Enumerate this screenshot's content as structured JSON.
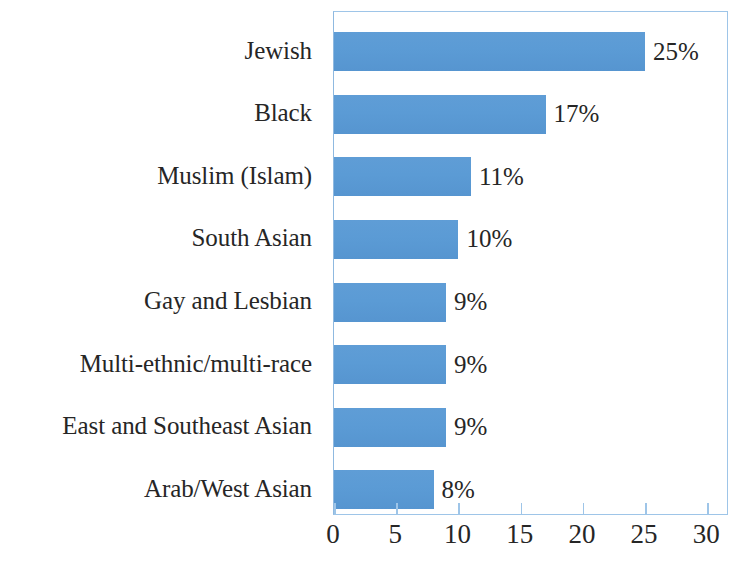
{
  "chart_data": {
    "type": "bar",
    "orientation": "horizontal",
    "title": "",
    "subtitle": "",
    "xlabel": "",
    "ylabel": "",
    "categories": [
      "Jewish",
      "Black",
      "Muslim (Islam)",
      "South Asian",
      "Gay and Lesbian",
      "Multi-ethnic/multi-race",
      "East and Southeast Asian",
      "Arab/West Asian"
    ],
    "values": [
      25,
      17,
      11,
      10,
      9,
      9,
      9,
      8
    ],
    "value_labels": [
      "25%",
      "17%",
      "11%",
      "10%",
      "9%",
      "9%",
      "9%",
      "8%"
    ],
    "xlim": [
      0,
      31.5
    ],
    "xticks": [
      0,
      5,
      10,
      15,
      20,
      25,
      30
    ],
    "xtick_labels": [
      "0",
      "5",
      "10",
      "15",
      "20",
      "25",
      "30"
    ],
    "grid": false,
    "legend": null,
    "legend_position": "none",
    "bar_color": "#5B9BD5",
    "plot_border_color": "#9EC5E8",
    "text_color": "#262626",
    "background_color": "#FFFFFF"
  }
}
